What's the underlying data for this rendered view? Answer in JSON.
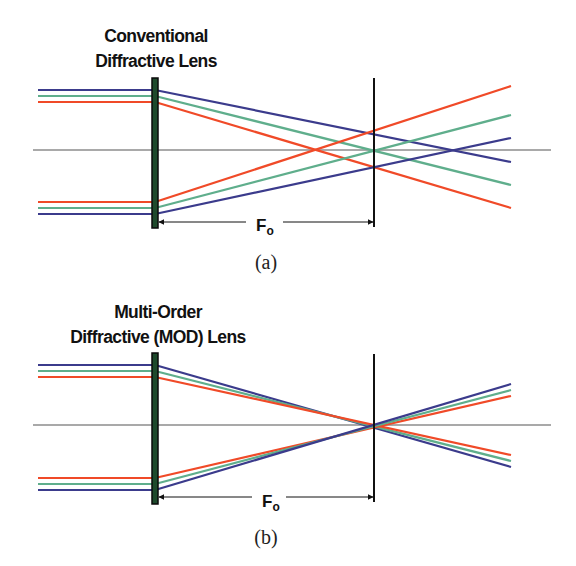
{
  "colors": {
    "blue": "#3b3b8c",
    "green": "#5fae8c",
    "red": "#f04a28",
    "axis": "#555555",
    "lens_fill": "#1e4a2c",
    "lens_edge": "#0a0a0a",
    "focal_line": "#111111"
  },
  "panels": [
    {
      "id": "a",
      "title_lines": [
        "Conventional",
        "Diffractive Lens"
      ],
      "title_x": 156,
      "title_y": [
        42,
        67
      ],
      "caption": "(a)",
      "caption_y": 269,
      "axis_y": 150,
      "axis_x": [
        33,
        551
      ],
      "lens": {
        "x": 155,
        "top": 78,
        "bottom": 228
      },
      "focal_plane": {
        "x": 374,
        "top": 78,
        "bottom": 227
      },
      "focal_label": {
        "main": "F",
        "sub": "o",
        "arrow_y": 222,
        "gap": [
          246,
          283
        ],
        "text_x": 256,
        "text_y": 231
      },
      "ray_start_x": 38,
      "ray_end_x": 511,
      "rays": [
        {
          "color": "blue",
          "y_in": 90,
          "end_y": 162
        },
        {
          "color": "green",
          "y_in": 96,
          "end_y": 185
        },
        {
          "color": "red",
          "y_in": 102,
          "end_y": 208
        },
        {
          "color": "red",
          "y_in": 202,
          "end_y": 86
        },
        {
          "color": "green",
          "y_in": 208,
          "end_y": 115
        },
        {
          "color": "blue",
          "y_in": 214,
          "end_y": 138
        }
      ],
      "foci": {
        "red_x": 317,
        "green_x": 374,
        "blue_x": 453
      }
    },
    {
      "id": "b",
      "title_lines": [
        "Multi-Order",
        "Diffractive (MOD) Lens"
      ],
      "title_x": 158,
      "title_y": [
        318,
        343
      ],
      "caption": "(b)",
      "caption_y": 544,
      "axis_y": 425,
      "axis_x": [
        33,
        551
      ],
      "lens": {
        "x": 155,
        "top": 353,
        "bottom": 504
      },
      "focal_plane": {
        "x": 374,
        "top": 354,
        "bottom": 502
      },
      "focal_label": {
        "main": "F",
        "sub": "o",
        "arrow_y": 497,
        "gap": [
          252,
          286
        ],
        "text_x": 262,
        "text_y": 507
      },
      "ray_start_x": 38,
      "ray_end_x": 511,
      "rays": [
        {
          "color": "blue",
          "y_in": 365,
          "end_y": 467
        },
        {
          "color": "green",
          "y_in": 371,
          "end_y": 461
        },
        {
          "color": "red",
          "y_in": 377,
          "end_y": 455
        },
        {
          "color": "red",
          "y_in": 478,
          "end_y": 396
        },
        {
          "color": "green",
          "y_in": 484,
          "end_y": 390
        },
        {
          "color": "blue",
          "y_in": 490,
          "end_y": 384
        }
      ],
      "foci": {
        "red_x": 374,
        "green_x": 374,
        "blue_x": 374
      }
    }
  ]
}
